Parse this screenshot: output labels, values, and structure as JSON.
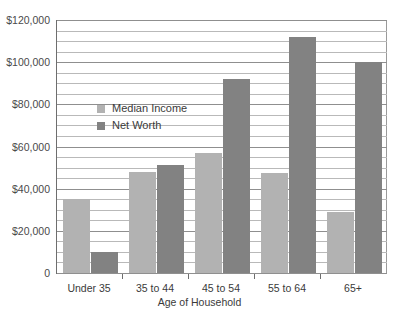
{
  "chart_data": {
    "type": "bar",
    "title": "",
    "xlabel": "Age of Household",
    "ylabel": "",
    "categories": [
      "Under 35",
      "35 to 44",
      "45 to 54",
      "55 to 64",
      "65+"
    ],
    "series": [
      {
        "name": "Median Income",
        "color": "#b2b2b2",
        "values": [
          35000,
          48000,
          57000,
          47500,
          29000
        ]
      },
      {
        "name": "Net Worth",
        "color": "#828282",
        "values": [
          10000,
          51000,
          92000,
          112000,
          100000
        ]
      }
    ],
    "ylim": [
      0,
      120000
    ],
    "y_ticks": [
      0,
      20000,
      40000,
      60000,
      80000,
      100000,
      120000
    ],
    "y_tick_labels": [
      "0",
      "$20,000",
      "$40,000",
      "$60,000",
      "$80,000",
      "$100,000",
      "$120,000"
    ],
    "minor_gridline_step": 5000,
    "grid": true,
    "legend_position": "inside-upper-left"
  }
}
